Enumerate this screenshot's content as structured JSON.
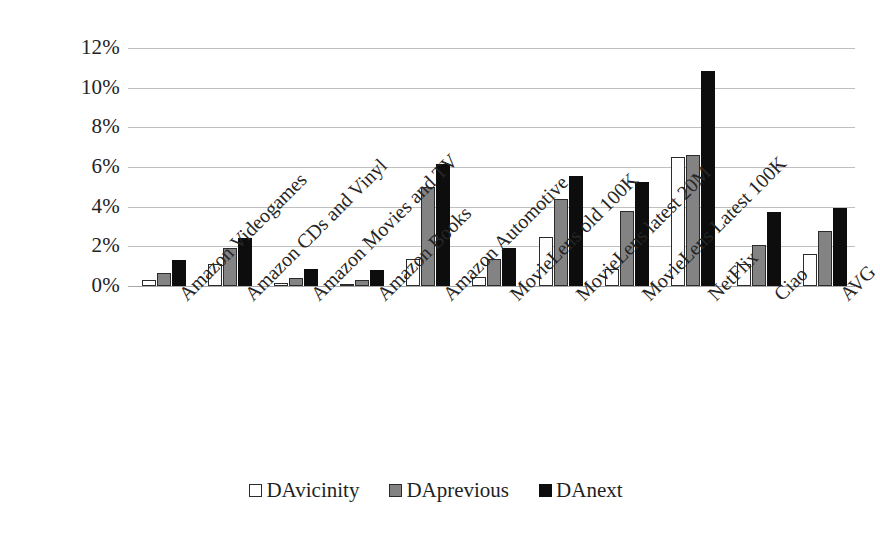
{
  "chart_data": {
    "type": "bar",
    "title": "",
    "subtitle": "",
    "xlabel": "",
    "ylabel": "",
    "ylim": [
      0,
      12
    ],
    "ytick_labels": [
      "12%",
      "10%",
      "8%",
      "6%",
      "4%",
      "2%",
      "0%"
    ],
    "ytick_values": [
      12,
      10,
      8,
      6,
      4,
      2,
      0
    ],
    "grid": true,
    "legend_position": "bottom",
    "value_suffix": "%",
    "categories": [
      "Amazon Videogames",
      "Amazon CDs and Vinyl",
      "Amazon Movies and TV",
      "Amazon Books",
      "Amazon Automotive",
      "MovieLens old 100K",
      "MovieLens latest 20M",
      "MovieLens Latest 100K",
      "NetFlix",
      "Ciao",
      "AVG"
    ],
    "series": [
      {
        "name": "DAvicinity",
        "color": "#ffffff",
        "values": [
          0.3,
          1.1,
          0.15,
          0.1,
          1.35,
          0.45,
          2.45,
          0.85,
          6.5,
          1.1,
          1.6
        ]
      },
      {
        "name": "DAprevious",
        "color": "#838383",
        "values": [
          0.65,
          1.9,
          0.4,
          0.3,
          5.0,
          1.35,
          4.4,
          3.8,
          6.6,
          2.05,
          2.75
        ]
      },
      {
        "name": "DAnext",
        "color": "#0d0d0d",
        "values": [
          1.3,
          2.4,
          0.85,
          0.8,
          6.15,
          1.9,
          5.55,
          5.25,
          10.85,
          3.75,
          3.95
        ]
      }
    ]
  }
}
